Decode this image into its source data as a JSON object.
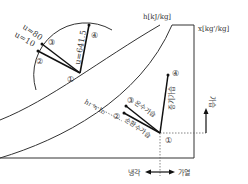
{
  "diagram": {
    "type": "psychrometric-chart-process",
    "axes": {
      "enthalpy_label": "h[kJ/kg]",
      "humidity_label": "x[kg'/kg]"
    },
    "protractor": {
      "u_80": "u=80",
      "u_10": "u=10",
      "u_641": "u=641.5",
      "points": [
        "②",
        "③",
        "④",
        "①"
      ]
    },
    "chart_points": {
      "p1": "①",
      "p2": "②",
      "p3": "③",
      "p4": "④"
    },
    "process_labels": {
      "warm_water_humidify": "온수가습",
      "circulating_water_humidify": "순환수가습",
      "steam_humidify": "증기가습",
      "h_equal": "h₁ ≒ h₂"
    },
    "direction_labels": {
      "humidify": "가습",
      "cooling": "냉각",
      "heating": "가열"
    },
    "colors": {
      "line": "#222222",
      "curve": "#333333",
      "dotted": "#666666"
    }
  }
}
